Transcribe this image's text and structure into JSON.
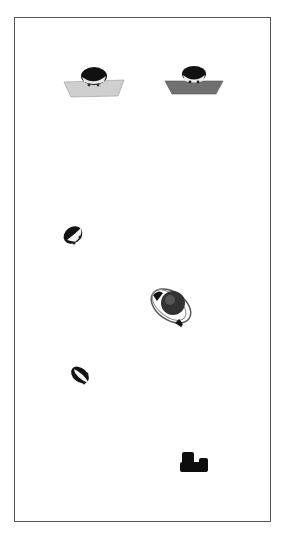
{
  "scene": {
    "description": "Top-down view of figures on a white field inside a framed area",
    "objects": [
      {
        "name": "person-at-desk-light",
        "icon": "person-desk-icon",
        "desk_color": "#c9c9c9"
      },
      {
        "name": "person-at-desk-dark",
        "icon": "person-desk-icon",
        "desk_color": "#6e6e6e"
      },
      {
        "name": "person-topdown-1",
        "icon": "person-head-icon"
      },
      {
        "name": "person-with-ring",
        "icon": "person-ring-icon"
      },
      {
        "name": "person-topdown-2",
        "icon": "person-head-icon"
      },
      {
        "name": "dark-object",
        "icon": "block-object-icon"
      }
    ]
  }
}
